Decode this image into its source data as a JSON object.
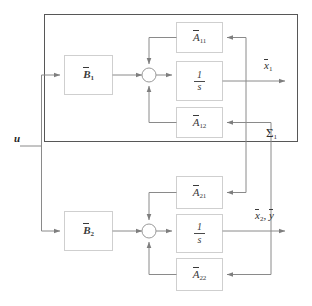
{
  "diagram": {
    "colors": {
      "line": "#8a8a8a",
      "outer_box": "#555555",
      "block_border": "#c9c9c9",
      "text": "#2e2e2e",
      "background": "#ffffff"
    },
    "outer_subsystem": {
      "label": "Σ",
      "label_sub": "1",
      "label_full": "Σ1"
    },
    "input": {
      "label": "u"
    },
    "blocks": [
      {
        "id": "B1",
        "base": "B",
        "sub": "1",
        "overbar": true,
        "text": "B1"
      },
      {
        "id": "B2",
        "base": "B",
        "sub": "2",
        "overbar": true,
        "text": "B2"
      },
      {
        "id": "A11",
        "base": "A",
        "sub": "11",
        "overbar": true,
        "text": "A11"
      },
      {
        "id": "A12",
        "base": "A",
        "sub": "12",
        "overbar": true,
        "text": "A12"
      },
      {
        "id": "A21",
        "base": "A",
        "sub": "21",
        "overbar": true,
        "text": "A21"
      },
      {
        "id": "A22",
        "base": "A",
        "sub": "22",
        "overbar": true,
        "text": "A22"
      },
      {
        "id": "INT1",
        "numerator": "1",
        "denominator": "s",
        "text": "1/s"
      },
      {
        "id": "INT2",
        "numerator": "1",
        "denominator": "s",
        "text": "1/s"
      }
    ],
    "outputs": [
      {
        "id": "x1",
        "base": "x",
        "sub": "1",
        "overbar": true,
        "text": "x1"
      },
      {
        "id": "x2y",
        "text": "x2, y",
        "parts": [
          {
            "base": "x",
            "sub": "2",
            "overbar": true
          },
          {
            "base": "y",
            "sub": "",
            "overbar": true
          }
        ]
      }
    ],
    "summing_junctions": [
      {
        "id": "sum1",
        "inputs": [
          "left",
          "top",
          "bottom"
        ],
        "output": "right"
      },
      {
        "id": "sum2",
        "inputs": [
          "left",
          "top",
          "bottom"
        ],
        "output": "right"
      }
    ]
  }
}
